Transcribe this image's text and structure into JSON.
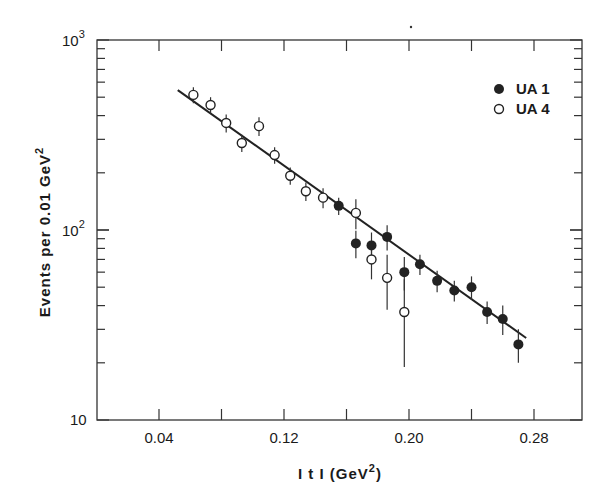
{
  "chart_data": {
    "type": "scatter",
    "title": "",
    "xlabel": "|t| (GeV²)",
    "ylabel": "Events per 0.01 GeV²",
    "xlim": [
      0.0,
      0.31
    ],
    "ylim": [
      10,
      1000
    ],
    "yscale": "log",
    "grid": false,
    "legend_position": "upper right",
    "x_ticks": [
      0.04,
      0.08,
      0.12,
      0.16,
      0.2,
      0.24,
      0.28
    ],
    "x_tick_labels": [
      "0.04",
      "0.12",
      "0.20",
      "0.28"
    ],
    "y_tick_labels": [
      "10",
      "10²",
      "10³"
    ],
    "series": [
      {
        "name": "UA 1",
        "marker": "filled-circle",
        "x": [
          0.155,
          0.166,
          0.176,
          0.186,
          0.197,
          0.207,
          0.218,
          0.229,
          0.24,
          0.25,
          0.26,
          0.27
        ],
        "y": [
          134,
          85,
          83,
          92,
          60,
          66,
          54,
          48,
          50,
          37,
          34,
          25
        ],
        "err": [
          14,
          14,
          14,
          14,
          12,
          8,
          7,
          6,
          7,
          5,
          6,
          5
        ]
      },
      {
        "name": "UA 4",
        "marker": "open-circle",
        "x": [
          0.062,
          0.073,
          0.083,
          0.093,
          0.104,
          0.114,
          0.124,
          0.134,
          0.145,
          0.166,
          0.176,
          0.186,
          0.197
        ],
        "y": [
          514,
          455,
          366,
          287,
          352,
          248,
          193,
          160,
          148,
          123,
          70,
          56,
          37
        ],
        "err": [
          50,
          45,
          40,
          30,
          40,
          25,
          20,
          18,
          18,
          22,
          15,
          18,
          18
        ]
      },
      {
        "name": "fit",
        "type": "line",
        "x": [
          0.052,
          0.275
        ],
        "y": [
          545,
          27
        ]
      }
    ]
  },
  "labels": {
    "y_top": "10",
    "y_top_exp": "3",
    "y_mid": "10",
    "y_mid_exp": "2",
    "y_bottom": "10",
    "x_0_04": "0.04",
    "x_0_12": "0.12",
    "x_0_20": "0.20",
    "x_0_28": "0.28",
    "x_title_main": "I t I  (GeV",
    "x_title_exp": "2",
    "x_title_close": ")",
    "y_title_main": "Events per 0.01 GeV",
    "y_title_exp": "2",
    "legend_ua1": "UA 1",
    "legend_ua4": "UA 4"
  }
}
